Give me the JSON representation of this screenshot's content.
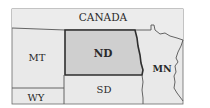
{
  "map": {
    "labels": {
      "canada": "CANADA",
      "nd": "ND",
      "mt": "MT",
      "mn": "MN",
      "sd": "SD",
      "wy": "WY"
    },
    "highlighted_region": "ND",
    "colors": {
      "background": "#ffffff",
      "land": "#e9e9e9",
      "highlight": "#cfcfcf",
      "border": "#3a3a3a",
      "text": "#2a2a2a"
    }
  }
}
